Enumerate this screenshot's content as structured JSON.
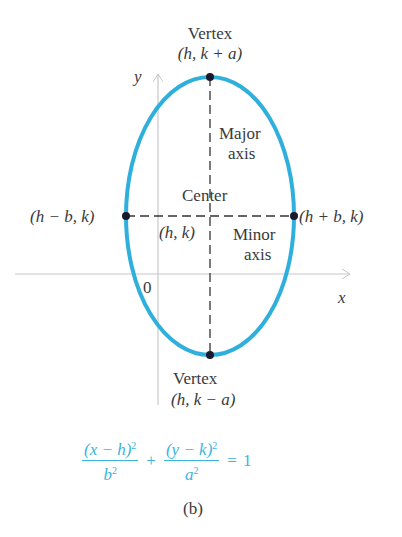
{
  "figure": {
    "caption": "(b)",
    "colors": {
      "ellipse": "#2fb0dc",
      "axes": "#c8c8c8",
      "dashes": "#333333",
      "points": "#1a1a2e",
      "equation": "#3cb4dc",
      "text": "#3a3a3a"
    },
    "ellipse": {
      "cx": 210,
      "cy": 216,
      "rx": 84,
      "ry": 139
    },
    "axes": {
      "x_label": "x",
      "y_label": "y",
      "origin_label": "0"
    },
    "labels": {
      "top_vertex_title": "Vertex",
      "top_vertex_coords": "(h, k + a)",
      "bottom_vertex_title": "Vertex",
      "bottom_vertex_coords": "(h, k − a)",
      "left_point": "(h − b, k)",
      "right_point": "(h + b, k)",
      "center_title": "Center",
      "center_coords": "(h, k)",
      "major_axis_line1": "Major",
      "major_axis_line2": "axis",
      "minor_axis_line1": "Minor",
      "minor_axis_line2": "axis"
    },
    "equation": {
      "term1_num": "(x − h)",
      "term1_num_exp": "2",
      "term1_den": "b",
      "term1_den_exp": "2",
      "plus": "+",
      "term2_num": "(y − k)",
      "term2_num_exp": "2",
      "term2_den": "a",
      "term2_den_exp": "2",
      "equals": "=",
      "rhs": "1"
    }
  }
}
